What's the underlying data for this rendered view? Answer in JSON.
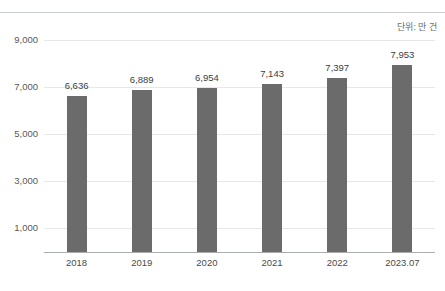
{
  "header": {
    "cropped_heading_text": "",
    "divider": true
  },
  "unit_caption": "단위: 만 건",
  "chart_data": {
    "type": "bar",
    "title": "",
    "subtitle": "",
    "xlabel": "",
    "ylabel": "",
    "unit_note": "단위: 만 건",
    "categories": [
      "2018",
      "2019",
      "2020",
      "2021",
      "2022",
      "2023.07"
    ],
    "values": [
      6636,
      6889,
      6954,
      7143,
      7397,
      7953
    ],
    "value_labels": [
      "6,636",
      "6,889",
      "6,954",
      "7,143",
      "7,397",
      "7,953"
    ],
    "ylim": [
      0,
      9000
    ],
    "yticks": [
      1000,
      3000,
      5000,
      7000,
      9000
    ],
    "ytick_labels": [
      "1,000",
      "3,000",
      "5,000",
      "7,000",
      "9,000"
    ],
    "grid": true,
    "legend": null,
    "series": [
      {
        "name": "",
        "values": [
          6636,
          6889,
          6954,
          7143,
          7397,
          7953
        ],
        "color": "#6b6b6b"
      }
    ]
  },
  "colors": {
    "bar": "#6b6b6b",
    "gridline": "#e6e7e9",
    "axis": "#a9acb1",
    "divider": "#c9ccd1",
    "value_text": "#3d3d3f",
    "tick_text": "#4a4a4c",
    "caption_text": "#6d6d6d",
    "background": "#ffffff"
  }
}
